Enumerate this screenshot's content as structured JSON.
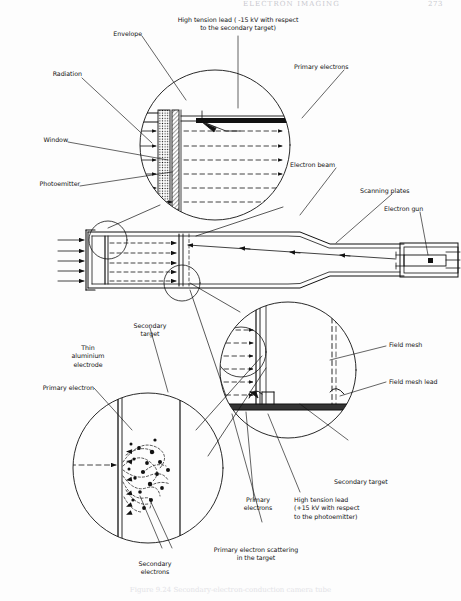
{
  "header": {
    "running_title": "ELECTRON IMAGING",
    "page_number": "273"
  },
  "figure": {
    "caption": "Figure 9.24  Secondary-electron-conduction camera tube",
    "type": "technical-cross-section-diagram"
  },
  "labels": {
    "envelope": "Envelope",
    "high_tension_lead_top": "High tension lead ( -15 kV with respect\nto the secondary target)",
    "primary_electrons_top": "Primary electrons",
    "radiation": "Radiation",
    "window": "Window",
    "photoemitter": "Photoemitter",
    "electron_beam": "Electron beam",
    "scanning_plates": "Scanning plates",
    "electron_gun": "Electron gun",
    "secondary_target_upper": "Secondary\ntarget",
    "thin_aluminium_electrode": "Thin\naluminium\nelectrode",
    "primary_electron": "Primary electron",
    "field_mesh": "Field mesh",
    "field_mesh_lead": "Field mesh lead",
    "secondary_target_lower": "Secondary target",
    "high_tension_lead_bottom": "High tension lead\n(+15 kV with respect\nto the photoemitter)",
    "primary_electrons_bottom": "Primary\nelectrons",
    "primary_electron_scattering": "Primary electron scattering\nin the target",
    "secondary_electrons": "Secondary\nelectrons"
  },
  "colors": {
    "ink": "#111111",
    "paper": "#fdfdfd",
    "faded_header": "#c9c9cf"
  }
}
